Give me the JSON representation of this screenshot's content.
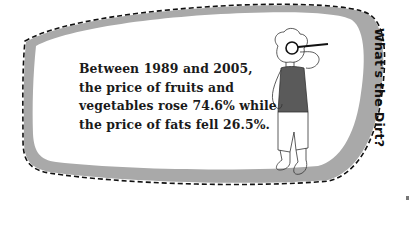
{
  "callout": {
    "title": "What's the Dirt?",
    "fact_lines": [
      "Between 1989 and 2005,",
      "the price of fruits and",
      "vegetables rose 74.6% while",
      "the price of fats fell 26.5%."
    ],
    "fact_full": "Between 1989 and 2005, the price of fruits and vegetables rose 74.6% while the price of fats fell 26.5%.",
    "stats": {
      "period_start": 1989,
      "period_end": 2005,
      "fruits_vegetables_price_change_pct": 74.6,
      "fats_price_change_pct": -26.5
    },
    "illustration": "person-with-magnifying-glass"
  },
  "colors": {
    "bubble_fill": "#ffffff",
    "bubble_shadow": "#a9a9a9",
    "dash_stroke": "#111111",
    "shirt": "#5a5a5a",
    "text": "#1a1a1a"
  }
}
